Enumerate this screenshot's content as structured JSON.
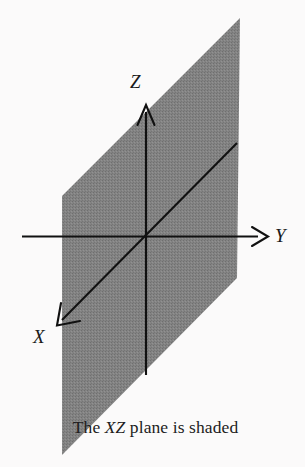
{
  "figure": {
    "background_color": "#fbfafa",
    "plane": {
      "name": "XZ plane",
      "fill_color": "#808080",
      "shaded": true,
      "vertices": [
        [
          240,
          18
        ],
        [
          62,
          196
        ],
        [
          62,
          455
        ],
        [
          237,
          278
        ]
      ]
    },
    "axes": [
      {
        "id": "z",
        "label": "Z",
        "orientation": "vertical",
        "direction": "up",
        "color": "#111111",
        "from": [
          146,
          375
        ],
        "to": [
          146,
          105
        ],
        "arrowhead": true
      },
      {
        "id": "y",
        "label": "Y",
        "orientation": "horizontal",
        "direction": "right",
        "color": "#111111",
        "from": [
          22,
          236
        ],
        "to": [
          268,
          236
        ],
        "arrowhead": true
      },
      {
        "id": "x",
        "label": "X",
        "orientation": "diagonal",
        "direction": "down-left",
        "color": "#111111",
        "from": [
          237,
          143
        ],
        "to": [
          57,
          325
        ],
        "arrowhead": true
      }
    ],
    "origin": [
      146,
      237
    ],
    "caption": {
      "before": "The ",
      "emphasis": "XZ",
      "after": " plane is shaded",
      "full_text": "The XZ plane is shaded"
    }
  }
}
